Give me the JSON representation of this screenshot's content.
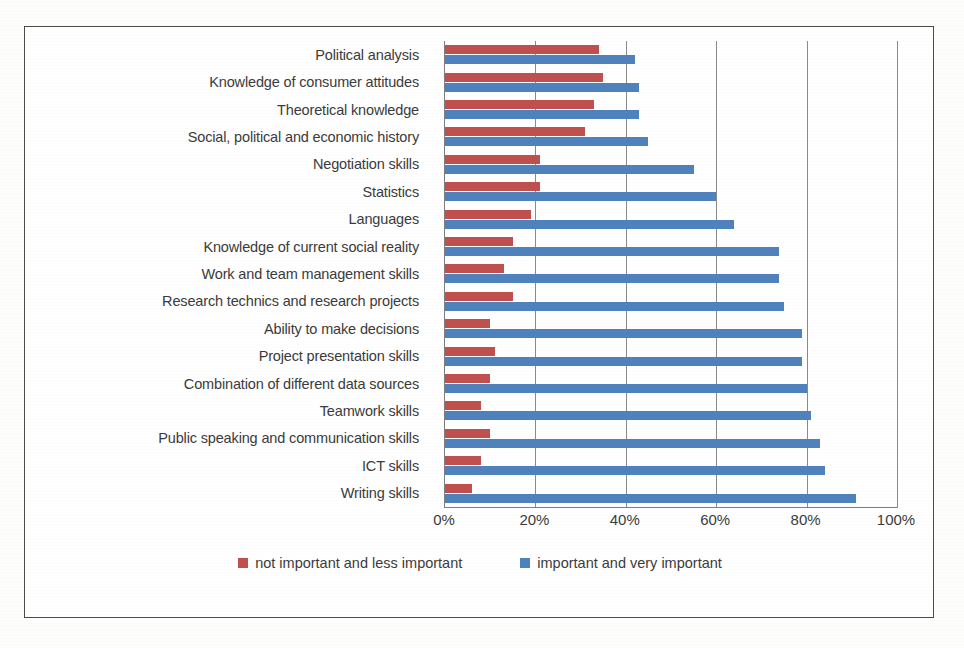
{
  "chart_data": {
    "type": "bar",
    "orientation": "horizontal",
    "title": "",
    "xlabel": "",
    "ylabel": "",
    "xlim": [
      0,
      100
    ],
    "xticks": [
      "0%",
      "20%",
      "40%",
      "60%",
      "80%",
      "100%"
    ],
    "xtick_values": [
      0,
      20,
      40,
      60,
      80,
      100
    ],
    "grid": true,
    "legend_position": "bottom",
    "categories": [
      "Political analysis",
      "Knowledge of consumer attitudes",
      "Theoretical knowledge",
      "Social, political and economic history",
      "Negotiation skills",
      "Statistics",
      "Languages",
      "Knowledge of current social reality",
      "Work and team management skills",
      "Research technics and research projects",
      "Ability to make decisions",
      "Project presentation skills",
      "Combination of different data sources",
      "Teamwork skills",
      "Public speaking and communication skills",
      "ICT skills",
      "Writing skills"
    ],
    "series": [
      {
        "name": "not important and less important",
        "color": "#c0504d",
        "values": [
          34,
          35,
          33,
          31,
          21,
          21,
          19,
          15,
          13,
          15,
          10,
          11,
          10,
          8,
          10,
          8,
          6
        ]
      },
      {
        "name": "important and very important",
        "color": "#4f81bd",
        "values": [
          42,
          43,
          43,
          45,
          55,
          60,
          64,
          74,
          74,
          75,
          79,
          79,
          80,
          81,
          83,
          84,
          91
        ]
      }
    ]
  },
  "legend": {
    "items": [
      {
        "label": "not important and less important",
        "swatch": "red-swatch-icon"
      },
      {
        "label": "important and very important",
        "swatch": "blue-swatch-icon"
      }
    ]
  }
}
